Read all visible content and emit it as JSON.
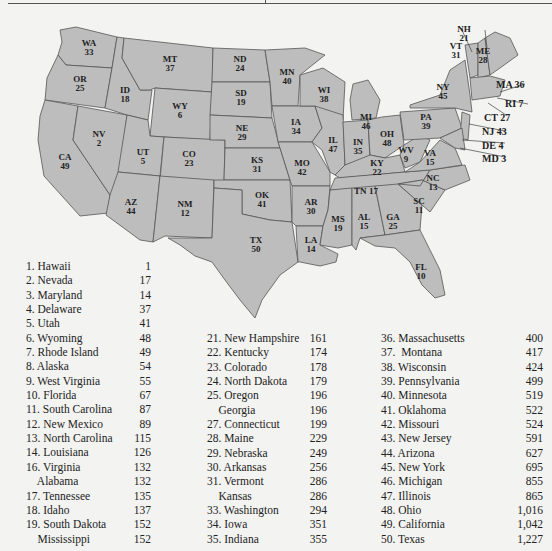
{
  "figure": {
    "type": "choropleth-style labeled map with ranking table",
    "map_labels": [
      {
        "abbr": "WA",
        "rank": "33"
      },
      {
        "abbr": "OR",
        "rank": "25"
      },
      {
        "abbr": "CA",
        "rank": "49"
      },
      {
        "abbr": "ID",
        "rank": "18"
      },
      {
        "abbr": "NV",
        "rank": "2"
      },
      {
        "abbr": "MT",
        "rank": "37"
      },
      {
        "abbr": "WY",
        "rank": "6"
      },
      {
        "abbr": "UT",
        "rank": "5"
      },
      {
        "abbr": "AZ",
        "rank": "44"
      },
      {
        "abbr": "CO",
        "rank": "23"
      },
      {
        "abbr": "NM",
        "rank": "12"
      },
      {
        "abbr": "ND",
        "rank": "24"
      },
      {
        "abbr": "SD",
        "rank": "19"
      },
      {
        "abbr": "NE",
        "rank": "29"
      },
      {
        "abbr": "KS",
        "rank": "31"
      },
      {
        "abbr": "OK",
        "rank": "41"
      },
      {
        "abbr": "TX",
        "rank": "50"
      },
      {
        "abbr": "MN",
        "rank": "40"
      },
      {
        "abbr": "IA",
        "rank": "34"
      },
      {
        "abbr": "MO",
        "rank": "42"
      },
      {
        "abbr": "AR",
        "rank": "30"
      },
      {
        "abbr": "LA",
        "rank": "14"
      },
      {
        "abbr": "WI",
        "rank": "38"
      },
      {
        "abbr": "IL",
        "rank": "47"
      },
      {
        "abbr": "MI",
        "rank": "46"
      },
      {
        "abbr": "IN",
        "rank": "35"
      },
      {
        "abbr": "OH",
        "rank": "48"
      },
      {
        "abbr": "KY",
        "rank": "22"
      },
      {
        "abbr": "TN",
        "rank": "17"
      },
      {
        "abbr": "MS",
        "rank": "19"
      },
      {
        "abbr": "AL",
        "rank": "15"
      },
      {
        "abbr": "GA",
        "rank": "25"
      },
      {
        "abbr": "FL",
        "rank": "10"
      },
      {
        "abbr": "SC",
        "rank": "11"
      },
      {
        "abbr": "NC",
        "rank": "13"
      },
      {
        "abbr": "VA",
        "rank": "15"
      },
      {
        "abbr": "WV",
        "rank": "9"
      },
      {
        "abbr": "PA",
        "rank": "39"
      },
      {
        "abbr": "NY",
        "rank": "45"
      },
      {
        "abbr": "VT",
        "rank": "31"
      },
      {
        "abbr": "NH",
        "rank": "21"
      },
      {
        "abbr": "ME",
        "rank": "28"
      }
    ],
    "callouts": [
      {
        "text": "MA 36"
      },
      {
        "text": "RI 7"
      },
      {
        "text": "CT 27"
      },
      {
        "text": "NJ 43"
      },
      {
        "text": "DE 4"
      },
      {
        "text": "MD 3"
      }
    ],
    "table": {
      "columns": [
        [
          {
            "name": "1. Hawaii",
            "value": "1"
          },
          {
            "name": "2. Nevada",
            "value": "17"
          },
          {
            "name": "3. Maryland",
            "value": "14"
          },
          {
            "name": "4. Delaware",
            "value": "37"
          },
          {
            "name": "5. Utah",
            "value": "41"
          },
          {
            "name": "6. Wyoming",
            "value": "48"
          },
          {
            "name": "7. Rhode Island",
            "value": "49"
          },
          {
            "name": "8. Alaska",
            "value": "54"
          },
          {
            "name": "9. West Virginia",
            "value": "55"
          },
          {
            "name": "10. Florida",
            "value": "67"
          },
          {
            "name": "11. South Carolina",
            "value": "87"
          },
          {
            "name": "12. New Mexico",
            "value": "89"
          },
          {
            "name": "13. North Carolina",
            "value": "115"
          },
          {
            "name": "14. Louisiana",
            "value": "126"
          },
          {
            "name": "16. Virginia",
            "value": "132"
          },
          {
            "name": "    Alabama",
            "value": "132"
          },
          {
            "name": "17. Tennessee",
            "value": "135"
          },
          {
            "name": "18. Idaho",
            "value": "137"
          },
          {
            "name": "19. South Dakota",
            "value": "152"
          },
          {
            "name": "    Mississippi",
            "value": "152"
          }
        ],
        [
          {
            "name": "21. New Hampshire",
            "value": "161"
          },
          {
            "name": "22. Kentucky",
            "value": "174"
          },
          {
            "name": "23. Colorado",
            "value": "178"
          },
          {
            "name": "24. North Dakota",
            "value": "179"
          },
          {
            "name": "25. Oregon",
            "value": "196"
          },
          {
            "name": "    Georgia",
            "value": "196"
          },
          {
            "name": "27. Connecticut",
            "value": "199"
          },
          {
            "name": "28. Maine",
            "value": "229"
          },
          {
            "name": "29. Nebraska",
            "value": "249"
          },
          {
            "name": "30. Arkansas",
            "value": "256"
          },
          {
            "name": "31. Vermont",
            "value": "286"
          },
          {
            "name": "    Kansas",
            "value": "286"
          },
          {
            "name": "33. Washington",
            "value": "294"
          },
          {
            "name": "34. Iowa",
            "value": "351"
          },
          {
            "name": "35. Indiana",
            "value": "355"
          }
        ],
        [
          {
            "name": "36. Massachusetts",
            "value": "400"
          },
          {
            "name": "37.  Montana",
            "value": "417"
          },
          {
            "name": "38. Wisconsin",
            "value": "424"
          },
          {
            "name": "39. Pennsylvania",
            "value": "499"
          },
          {
            "name": "40. Minnesota",
            "value": "519"
          },
          {
            "name": "41. Oklahoma",
            "value": "522"
          },
          {
            "name": "42. Missouri",
            "value": "524"
          },
          {
            "name": "43. New Jersey",
            "value": "591"
          },
          {
            "name": "44. Arizona",
            "value": "627"
          },
          {
            "name": "45. New York",
            "value": "695"
          },
          {
            "name": "46. Michigan",
            "value": "855"
          },
          {
            "name": "47. Illinois",
            "value": "865"
          },
          {
            "name": "48. Ohio",
            "value": "1,016"
          },
          {
            "name": "49. California",
            "value": "1,042"
          },
          {
            "name": "50. Texas",
            "value": "1,227"
          }
        ]
      ]
    }
  }
}
